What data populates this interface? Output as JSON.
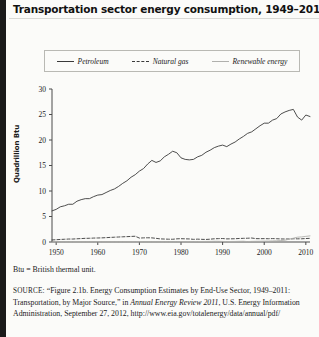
{
  "figure": {
    "title": "Transportation sector energy consumption, 1949–2011",
    "btu_note": "Btu = British thermal unit.",
    "source": {
      "label": "SOURCE:",
      "line1": "“Figure 2.1b. Energy Consumption Estimates by End-Use",
      "line2a": "Sector, 1949–2011: Transportation, by Major Source,” in ",
      "line2b": "Annual",
      "line3a": "Energy Review 2011",
      "line3b": ", U.S. Energy Information Administration,",
      "line4": "September 27, 2012, http://www.eia.gov/totalenergy/data/annual/pdf/"
    }
  },
  "chart_data": {
    "type": "line",
    "title": "Transportation sector energy consumption, 1949–2011",
    "xlabel": "",
    "ylabel": "Quadrillion Btu",
    "xlim": [
      1949,
      2011
    ],
    "ylim": [
      0,
      30
    ],
    "xticks": [
      "1950",
      "1960",
      "1970",
      "1980",
      "1990",
      "2000",
      "2010"
    ],
    "xtick_values": [
      1950,
      1960,
      1970,
      1980,
      1990,
      2000,
      2010
    ],
    "yticks": [
      "0",
      "5",
      "10",
      "15",
      "20",
      "25",
      "30"
    ],
    "ytick_values": [
      0,
      5,
      10,
      15,
      20,
      25,
      30
    ],
    "grid": false,
    "legend_position": "top",
    "colors": {
      "petroleum": "#3a3a3a",
      "natural_gas": "#3a3a3a",
      "renewable": "#b0b0ad"
    },
    "x": [
      1949,
      1950,
      1951,
      1952,
      1953,
      1954,
      1955,
      1956,
      1957,
      1958,
      1959,
      1960,
      1961,
      1962,
      1963,
      1964,
      1965,
      1966,
      1967,
      1968,
      1969,
      1970,
      1971,
      1972,
      1973,
      1974,
      1975,
      1976,
      1977,
      1978,
      1979,
      1980,
      1981,
      1982,
      1983,
      1984,
      1985,
      1986,
      1987,
      1988,
      1989,
      1990,
      1991,
      1992,
      1993,
      1994,
      1995,
      1996,
      1997,
      1998,
      1999,
      2000,
      2001,
      2002,
      2003,
      2004,
      2005,
      2006,
      2007,
      2008,
      2009,
      2010,
      2011
    ],
    "series": [
      {
        "name": "Petroleum",
        "style": "solid",
        "color": "#3a3a3a",
        "values": [
          6.1,
          6.4,
          6.9,
          7.1,
          7.4,
          7.4,
          8.0,
          8.3,
          8.5,
          8.5,
          8.9,
          9.2,
          9.3,
          9.7,
          10.1,
          10.4,
          10.9,
          11.5,
          12.0,
          12.7,
          13.2,
          13.9,
          14.4,
          15.3,
          16.0,
          15.6,
          15.9,
          16.7,
          17.2,
          17.8,
          17.5,
          16.5,
          16.2,
          16.1,
          16.2,
          16.7,
          17.0,
          17.6,
          18.0,
          18.5,
          18.8,
          19.0,
          18.7,
          19.2,
          19.6,
          20.2,
          20.7,
          21.3,
          21.6,
          22.2,
          22.8,
          23.3,
          23.3,
          23.9,
          24.2,
          25.1,
          25.5,
          25.8,
          26.0,
          24.5,
          23.9,
          24.9,
          24.6
        ]
      },
      {
        "name": "Natural gas",
        "style": "dashed",
        "color": "#3a3a3a",
        "values": [
          0.4,
          0.45,
          0.5,
          0.54,
          0.58,
          0.58,
          0.63,
          0.67,
          0.72,
          0.73,
          0.77,
          0.79,
          0.81,
          0.85,
          0.9,
          0.94,
          0.98,
          1.02,
          1.05,
          1.09,
          1.13,
          0.77,
          0.81,
          0.83,
          0.81,
          0.72,
          0.61,
          0.58,
          0.55,
          0.54,
          0.62,
          0.65,
          0.62,
          0.6,
          0.52,
          0.56,
          0.52,
          0.5,
          0.55,
          0.63,
          0.66,
          0.68,
          0.61,
          0.62,
          0.64,
          0.69,
          0.72,
          0.74,
          0.78,
          0.66,
          0.65,
          0.66,
          0.64,
          0.67,
          0.64,
          0.6,
          0.59,
          0.59,
          0.63,
          0.62,
          0.63,
          0.68,
          0.72
        ]
      },
      {
        "name": "Renewable energy",
        "style": "solid",
        "color": "#b0b0ad",
        "values": [
          0.0,
          0.0,
          0.0,
          0.0,
          0.0,
          0.0,
          0.0,
          0.0,
          0.0,
          0.0,
          0.0,
          0.0,
          0.0,
          0.0,
          0.0,
          0.0,
          0.0,
          0.0,
          0.0,
          0.0,
          0.0,
          0.0,
          0.0,
          0.0,
          0.0,
          0.0,
          0.0,
          0.0,
          0.0,
          0.0,
          0.02,
          0.03,
          0.04,
          0.05,
          0.06,
          0.08,
          0.1,
          0.11,
          0.12,
          0.14,
          0.14,
          0.11,
          0.09,
          0.1,
          0.11,
          0.13,
          0.15,
          0.08,
          0.12,
          0.14,
          0.15,
          0.17,
          0.18,
          0.21,
          0.24,
          0.28,
          0.35,
          0.55,
          0.75,
          0.95,
          1.0,
          1.1,
          1.2
        ]
      }
    ]
  },
  "legend": {
    "items": [
      {
        "label": "Petroleum",
        "style": "solid"
      },
      {
        "label": "Natural gas",
        "style": "dashed"
      },
      {
        "label": "Renewable energy",
        "style": "light"
      }
    ]
  }
}
